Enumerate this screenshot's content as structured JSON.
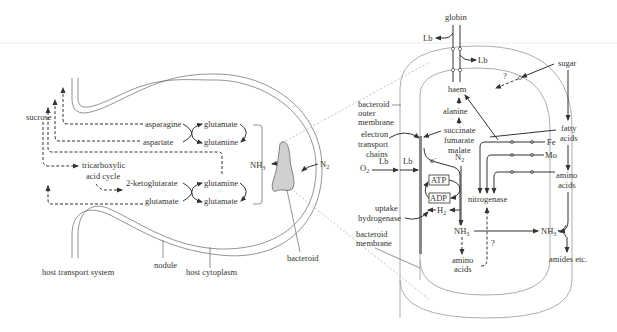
{
  "diagram": {
    "type": "biological-pathway",
    "left_panel": {
      "title": "root nodule nitrogen assimilation",
      "labels": {
        "sucrose": "sucrose",
        "tca1": "tricarboxylic",
        "tca2": "acid cycle",
        "asparagine": "asparagine",
        "aspartate": "aspartate",
        "ketoglutarate": "2-ketoglutarate",
        "glutamate_l": "glutamate",
        "glutamate_r1": "glutamate",
        "glutamine_r1": "glutamine",
        "glutamine_r2": "glutamine",
        "glutamate_r2": "glutamate",
        "nh3": "NH",
        "nh3_sub": "3",
        "n2": "N",
        "n2_sub": "2",
        "bacteroid": "bacteroid",
        "host_transport": "host transport system",
        "nodule": "nodule",
        "host_cytoplasm": "host cytoplasm"
      }
    },
    "right_panel": {
      "title": "bacteroid detail",
      "labels": {
        "globin": "globin",
        "lb_top": "Lb",
        "lb_right": "Lb",
        "haem": "haem",
        "alanine": "alanine",
        "sugar": "sugar",
        "question1": "?",
        "outer1": "bacteroid",
        "outer2": "outer",
        "outer3": "membrane",
        "etc1": "electron",
        "etc2": "transport",
        "etc3": "chains",
        "succinate": "succinate",
        "fumarate": "fumarate",
        "malate": "malate",
        "fatty1": "fatty",
        "fatty2": "acids",
        "fe": "Fe",
        "mo": "Mo",
        "amino_r1": "amino",
        "amino_r2": "acids",
        "o2": "O",
        "o2_sub": "2",
        "lb_o1": "Lb",
        "lb_o2": "Lb",
        "electron": "e",
        "electron_sup": "−",
        "n2": "N",
        "n2_sub": "2",
        "atp": "ATP",
        "adp": "ADP",
        "h2": "H",
        "h2_sub": "2",
        "nitrogenase": "nitrogenase",
        "uptake1": "uptake",
        "uptake2": "hydrogenase",
        "nh3_in": "NH",
        "nh3_in_sub": "3",
        "nh3_out": "NH",
        "nh3_out_sub": "3",
        "amino_in1": "amino",
        "amino_in2": "acids",
        "question2": "?",
        "bmem1": "bacteroid",
        "bmem2": "membrane",
        "amides": "amides etc."
      }
    },
    "colors": {
      "line": "#333333",
      "bacteroid_fill": "#d0d0d0",
      "membrane": "#999999",
      "background": "#ffffff"
    }
  }
}
